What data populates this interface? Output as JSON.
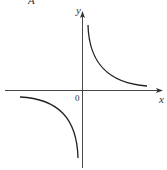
{
  "figure": {
    "option_label": "A",
    "y_axis_label": "y",
    "x_axis_label": "x",
    "origin_label": "0",
    "curve": "hyperbola y = k/x (k>0), branches in quadrants I and III"
  },
  "colors": {
    "line": "#222222",
    "background": "#ffffff"
  }
}
